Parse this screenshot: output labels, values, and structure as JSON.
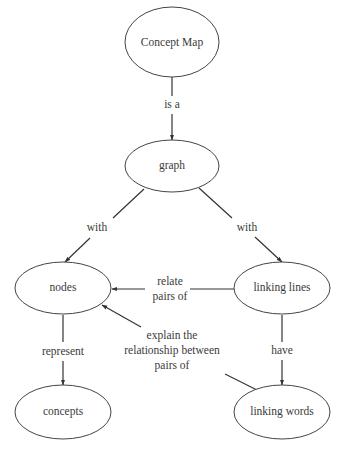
{
  "diagram": {
    "type": "concept-map",
    "colors": {
      "background": "#ffffff",
      "stroke": "#444444",
      "text": "#3a3a3a"
    },
    "nodes": [
      {
        "id": "concept-map",
        "label": "Concept Map",
        "cx": 172,
        "cy": 42,
        "rx": 47,
        "ry": 35
      },
      {
        "id": "graph",
        "label": "graph",
        "cx": 172,
        "cy": 166,
        "rx": 47,
        "ry": 26
      },
      {
        "id": "nodes",
        "label": "nodes",
        "cx": 63,
        "cy": 288,
        "rx": 48,
        "ry": 26
      },
      {
        "id": "linking-lines",
        "label": "linking lines",
        "cx": 282,
        "cy": 288,
        "rx": 48,
        "ry": 26
      },
      {
        "id": "concepts",
        "label": "concepts",
        "cx": 63,
        "cy": 412,
        "rx": 48,
        "ry": 27
      },
      {
        "id": "linking-words",
        "label": "linking words",
        "cx": 282,
        "cy": 412,
        "rx": 48,
        "ry": 27
      }
    ],
    "edges": [
      {
        "from": "concept-map",
        "to": "graph",
        "label_lines": [
          "is a"
        ]
      },
      {
        "from": "graph",
        "to": "nodes",
        "label_lines": [
          "with"
        ]
      },
      {
        "from": "graph",
        "to": "linking-lines",
        "label_lines": [
          "with"
        ]
      },
      {
        "from": "linking-lines",
        "to": "nodes",
        "label_lines": [
          "relate",
          "pairs of"
        ]
      },
      {
        "from": "linking-words",
        "to": "nodes",
        "label_lines": [
          "explain the",
          "relationship between",
          "pairs of"
        ]
      },
      {
        "from": "nodes",
        "to": "concepts",
        "label_lines": [
          "represent"
        ]
      },
      {
        "from": "linking-lines",
        "to": "linking-words",
        "label_lines": [
          "have"
        ]
      }
    ]
  },
  "labels": {
    "node_concept_map": "Concept Map",
    "node_graph": "graph",
    "node_nodes": "nodes",
    "node_linking_lines": "linking lines",
    "node_concepts": "concepts",
    "node_linking_words": "linking words",
    "edge_is_a": "is a",
    "edge_with_left": "with",
    "edge_with_right": "with",
    "edge_relate_1": "relate",
    "edge_relate_2": "pairs of",
    "edge_explain_1": "explain the",
    "edge_explain_2": "relationship between",
    "edge_explain_3": "pairs of",
    "edge_represent": "represent",
    "edge_have": "have"
  }
}
